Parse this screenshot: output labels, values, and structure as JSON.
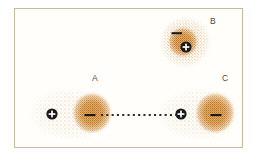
{
  "figure": {
    "border_color": "#c9b99a",
    "background_color": "#fffefb",
    "cloud_color": "#c8843a",
    "core_color": "#c07b2e",
    "charge_color": "#1a1a1a"
  },
  "atoms": [
    {
      "id": "atom-a",
      "label": "A",
      "shape": "ellipse",
      "cx": 70,
      "cy": 114,
      "rx": 42,
      "ry": 26,
      "positive_charge": {
        "symbol": "+",
        "x": 52,
        "y": 114
      },
      "negative_charge": {
        "symbol": "−",
        "x": 90,
        "y": 115
      },
      "dense_lobe": {
        "cx": 92,
        "cy": 113,
        "rx": 20,
        "ry": 21
      }
    },
    {
      "id": "atom-b",
      "label": "B",
      "shape": "circle",
      "cx": 185,
      "cy": 42,
      "rx": 26,
      "ry": 26,
      "positive_charge": {
        "symbol": "+",
        "x": 186,
        "y": 47
      },
      "negative_charge": {
        "symbol": "−",
        "x": 177,
        "y": 33
      },
      "dense_lobe": {
        "cx": 183,
        "cy": 42,
        "rx": 15,
        "ry": 15
      }
    },
    {
      "id": "atom-c",
      "label": "C",
      "shape": "ellipse",
      "cx": 199,
      "cy": 114,
      "rx": 42,
      "ry": 26,
      "positive_charge": {
        "symbol": "+",
        "x": 181,
        "y": 114
      },
      "negative_charge": {
        "symbol": "−",
        "x": 216,
        "y": 115
      },
      "dense_lobe": {
        "cx": 215,
        "cy": 113,
        "rx": 20,
        "ry": 21
      }
    }
  ],
  "interaction_line": {
    "name": "dotted-attraction-line",
    "style": "dotted",
    "x1": 101,
    "x2": 178,
    "y": 115,
    "dot_color": "#2b2b2b",
    "dot_size": 2.1,
    "dot_gap": 3.2
  }
}
